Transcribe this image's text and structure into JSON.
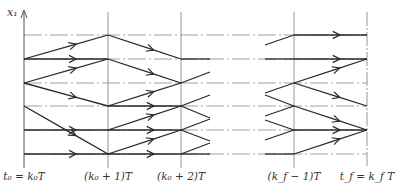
{
  "diagram": {
    "title": "",
    "axis_label": "x₁",
    "colors": {
      "line": "#2a2a2a",
      "grid": "#8a8a8a",
      "background": "#ffffff"
    },
    "time_steps": [
      {
        "id": "t0",
        "x": 24,
        "label": "t₀ = k₀T"
      },
      {
        "id": "t1",
        "x": 108,
        "label": "(k₀ + 1)T"
      },
      {
        "id": "t2",
        "x": 181,
        "label": "(k₀ + 2)T"
      },
      {
        "id": "tfm1",
        "x": 294,
        "label": "(k_f − 1)T"
      },
      {
        "id": "tf",
        "x": 367,
        "label": "t_f = k_f T"
      }
    ],
    "state_rows_y": [
      35,
      59,
      83,
      106,
      130,
      154
    ],
    "transitions": [
      {
        "from": [
          24,
          59
        ],
        "to": [
          108,
          35
        ]
      },
      {
        "from": [
          24,
          59
        ],
        "to": [
          108,
          59
        ]
      },
      {
        "from": [
          24,
          83
        ],
        "to": [
          108,
          59
        ]
      },
      {
        "from": [
          24,
          83
        ],
        "to": [
          108,
          106
        ]
      },
      {
        "from": [
          24,
          106
        ],
        "to": [
          108,
          154
        ]
      },
      {
        "from": [
          24,
          130
        ],
        "to": [
          108,
          130
        ]
      },
      {
        "from": [
          24,
          154
        ],
        "to": [
          108,
          154
        ]
      },
      {
        "from": [
          108,
          35
        ],
        "to": [
          181,
          59
        ]
      },
      {
        "from": [
          108,
          59
        ],
        "to": [
          181,
          83
        ]
      },
      {
        "from": [
          108,
          106
        ],
        "to": [
          181,
          83
        ]
      },
      {
        "from": [
          108,
          106
        ],
        "to": [
          181,
          106
        ]
      },
      {
        "from": [
          108,
          130
        ],
        "to": [
          181,
          106
        ]
      },
      {
        "from": [
          108,
          130
        ],
        "to": [
          181,
          130
        ]
      },
      {
        "from": [
          108,
          154
        ],
        "to": [
          181,
          130
        ]
      },
      {
        "from": [
          108,
          154
        ],
        "to": [
          181,
          154
        ]
      },
      {
        "from": [
          294,
          35
        ],
        "to": [
          367,
          35
        ]
      },
      {
        "from": [
          294,
          59
        ],
        "to": [
          367,
          59
        ]
      },
      {
        "from": [
          294,
          83
        ],
        "to": [
          367,
          59
        ]
      },
      {
        "from": [
          294,
          83
        ],
        "to": [
          367,
          106
        ]
      },
      {
        "from": [
          294,
          106
        ],
        "to": [
          367,
          130
        ]
      },
      {
        "from": [
          294,
          130
        ],
        "to": [
          367,
          130
        ]
      },
      {
        "from": [
          294,
          154
        ],
        "to": [
          367,
          130
        ]
      }
    ],
    "stubs": [
      {
        "from": [
          181,
          59
        ],
        "to": [
          210,
          59
        ]
      },
      {
        "from": [
          181,
          83
        ],
        "to": [
          210,
          72
        ]
      },
      {
        "from": [
          181,
          106
        ],
        "to": [
          210,
          95
        ]
      },
      {
        "from": [
          181,
          106
        ],
        "to": [
          210,
          118
        ]
      },
      {
        "from": [
          181,
          130
        ],
        "to": [
          210,
          119
        ]
      },
      {
        "from": [
          181,
          130
        ],
        "to": [
          210,
          141
        ]
      },
      {
        "from": [
          181,
          154
        ],
        "to": [
          210,
          143
        ]
      },
      {
        "from": [
          181,
          154
        ],
        "to": [
          210,
          154
        ]
      },
      {
        "from": [
          265,
          45
        ],
        "to": [
          294,
          35
        ]
      },
      {
        "from": [
          265,
          59
        ],
        "to": [
          294,
          59
        ]
      },
      {
        "from": [
          265,
          93
        ],
        "to": [
          294,
          83
        ]
      },
      {
        "from": [
          265,
          116
        ],
        "to": [
          294,
          106
        ]
      },
      {
        "from": [
          265,
          95
        ],
        "to": [
          294,
          106
        ]
      },
      {
        "from": [
          265,
          140
        ],
        "to": [
          294,
          130
        ]
      },
      {
        "from": [
          265,
          120
        ],
        "to": [
          294,
          130
        ]
      },
      {
        "from": [
          265,
          154
        ],
        "to": [
          294,
          154
        ]
      }
    ]
  }
}
